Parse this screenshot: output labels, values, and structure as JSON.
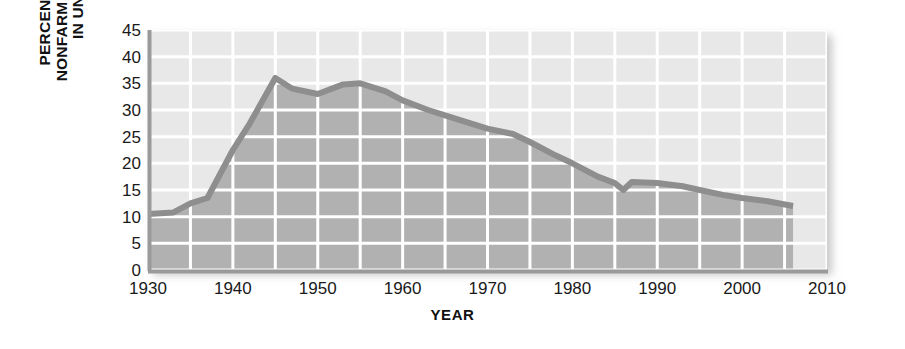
{
  "chart_data": {
    "type": "area",
    "title": "",
    "subtitle": "",
    "xlabel": "YEAR",
    "ylabel": "PERCENTAGE OF NONFARM WORKERS IN UNIONS",
    "ylabel_lines": [
      "PERCENTAGE OF",
      "NONFARM WORKERS",
      "IN UNIONS"
    ],
    "xlim": [
      1930,
      2010
    ],
    "ylim": [
      0,
      45
    ],
    "grid": true,
    "grid_x_step": 5,
    "grid_y_step": 5,
    "legend": "none",
    "xticks": [
      1930,
      1940,
      1950,
      1960,
      1970,
      1980,
      1990,
      2000,
      2010
    ],
    "xtick_labels": [
      "1930",
      "1940",
      "1950",
      "1960",
      "1970",
      "1980",
      "1990",
      "2000",
      "2010"
    ],
    "yticks": [
      0,
      5,
      10,
      15,
      20,
      25,
      30,
      35,
      40,
      45
    ],
    "ytick_labels": [
      "0",
      "5",
      "10",
      "15",
      "20",
      "25",
      "30",
      "35",
      "40",
      "45"
    ],
    "series": [
      {
        "name": "Percentage of nonfarm workers in unions",
        "x": [
          1930,
          1933,
          1935,
          1937,
          1940,
          1942,
          1945,
          1947,
          1950,
          1953,
          1955,
          1958,
          1960,
          1963,
          1965,
          1968,
          1970,
          1973,
          1975,
          1978,
          1980,
          1983,
          1985,
          1986,
          1987,
          1990,
          1993,
          1995,
          1998,
          2000,
          2003,
          2006
        ],
        "values": [
          10.5,
          10.8,
          12.5,
          13.5,
          22.5,
          27.5,
          36.0,
          34.0,
          33.0,
          34.8,
          35.0,
          33.5,
          31.8,
          30.0,
          29.0,
          27.5,
          26.5,
          25.5,
          24.0,
          21.5,
          20.0,
          17.5,
          16.3,
          15.0,
          16.5,
          16.3,
          15.7,
          15.0,
          14.0,
          13.5,
          12.9,
          12.0
        ]
      }
    ],
    "annotations": []
  },
  "colors": {
    "plot_background": "#eeeeee",
    "area_fill_below": "#b1b1b1",
    "area_fill_above": "#e8e8e8",
    "grid_line": "#ffffff",
    "data_line": "#8e8e8e",
    "axis_line": "#9a9a9a",
    "text": "#1a1a1a",
    "page_background": "#ffffff"
  }
}
